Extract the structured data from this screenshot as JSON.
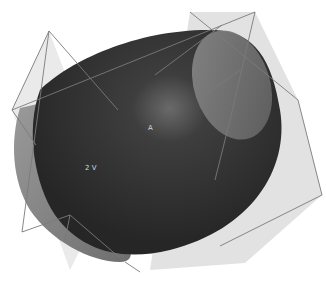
{
  "figure": {
    "width": 326,
    "height": 281,
    "colors": {
      "background": "#ffffff",
      "surface_dark": "#2e2e2e",
      "surface_highlight": "#6a6a6a",
      "outer_shell": "#8c8c8c",
      "cap_ellipse": "#7a7a7a",
      "plane_fill": "#e0e0e0",
      "plane_edge": "#7a7a7a"
    },
    "labels": {
      "center_label": "A",
      "lower_label": "2 V"
    }
  }
}
